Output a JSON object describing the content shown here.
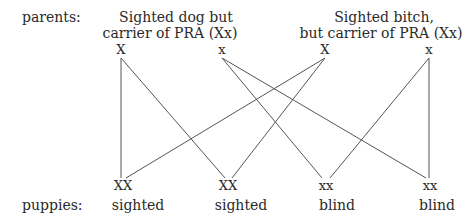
{
  "labels": {
    "parents": "parents:",
    "puppies": "puppies:"
  },
  "parents": [
    {
      "caption_line1": "Sighted dog but",
      "caption_line2": "carrier of PRA (Xx)",
      "alleles": [
        "X",
        "x"
      ]
    },
    {
      "caption_line1": "Sighted bitch,",
      "caption_line2": "but carrier of PRA (Xx)",
      "alleles": [
        "X",
        "x"
      ]
    }
  ],
  "puppies": [
    {
      "genotype": "XX",
      "phenotype": "sighted"
    },
    {
      "genotype": "XX",
      "phenotype": "sighted"
    },
    {
      "genotype": "xx",
      "phenotype": "blind"
    },
    {
      "genotype": "xx",
      "phenotype": "blind"
    }
  ],
  "colors": {
    "text": "#2a2a2a",
    "lines": "#555555",
    "background": "#ffffff"
  }
}
